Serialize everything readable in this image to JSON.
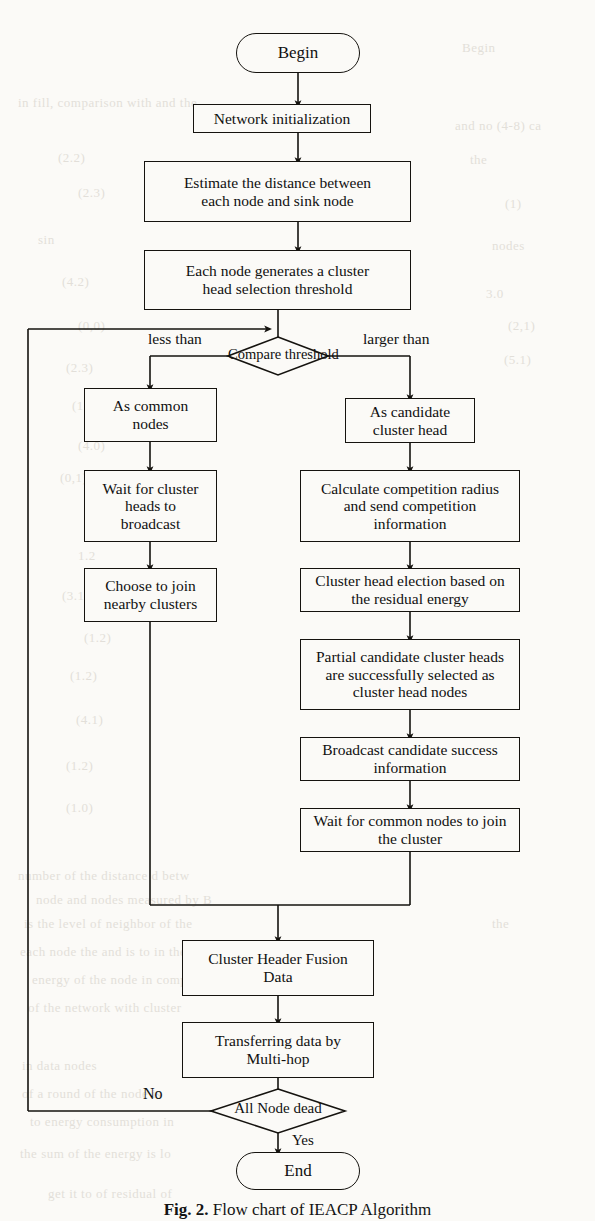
{
  "figure": {
    "caption_label": "Fig. 2.",
    "caption_text": "Flow chart of IEACP Algorithm",
    "background_color": "#fbfaf7",
    "line_color": "#15130f",
    "text_color": "#101010"
  },
  "nodes": {
    "begin": {
      "label": "Begin",
      "shape": "terminator"
    },
    "network_init": {
      "label": "Network initialization",
      "shape": "process"
    },
    "estimate_distance": {
      "label": "Estimate the distance between\neach node and sink node",
      "shape": "process"
    },
    "generate_threshold": {
      "label": "Each node generates a cluster\nhead selection threshold",
      "shape": "process"
    },
    "compare_threshold": {
      "label": "Compare threshold",
      "shape": "decision"
    },
    "as_common_nodes": {
      "label": "As common\nnodes",
      "shape": "process"
    },
    "wait_broadcast": {
      "label": "Wait for cluster\nheads to\nbroadcast",
      "shape": "process"
    },
    "choose_join": {
      "label": "Choose to join\nnearby clusters",
      "shape": "process"
    },
    "as_candidate": {
      "label": "As candidate\ncluster head",
      "shape": "process"
    },
    "calculate_radius": {
      "label": "Calculate competition radius\nand send competition\ninformation",
      "shape": "process"
    },
    "head_election": {
      "label": "Cluster head election based on\nthe residual energy",
      "shape": "process"
    },
    "partial_selected": {
      "label": "Partial candidate cluster heads\nare successfully selected as\ncluster head nodes",
      "shape": "process"
    },
    "broadcast_success": {
      "label": "Broadcast candidate success\ninformation",
      "shape": "process"
    },
    "wait_common_join": {
      "label": "Wait for common nodes to join\nthe cluster",
      "shape": "process"
    },
    "fusion_data": {
      "label": "Cluster Header Fusion\nData",
      "shape": "process"
    },
    "transfer_data": {
      "label": "Transferring data by\nMulti-hop",
      "shape": "process"
    },
    "all_node_dead": {
      "label": "All Node dead",
      "shape": "decision"
    },
    "end": {
      "label": "End",
      "shape": "terminator"
    }
  },
  "edge_labels": {
    "less_than": "less than",
    "larger_than": "larger than",
    "no": "No",
    "yes": "Yes"
  },
  "bleed_through": [
    {
      "text": "Begin",
      "x": 462,
      "y": 40
    },
    {
      "text": "in fill, comparison with  and  the",
      "x": 18,
      "y": 95
    },
    {
      "text": "and  no  (4-8)  ca",
      "x": 455,
      "y": 118
    },
    {
      "text": "(2.2)",
      "x": 58,
      "y": 150
    },
    {
      "text": "the",
      "x": 470,
      "y": 152
    },
    {
      "text": "(2.3)",
      "x": 78,
      "y": 185
    },
    {
      "text": "(1)",
      "x": 505,
      "y": 196
    },
    {
      "text": "sin",
      "x": 38,
      "y": 232
    },
    {
      "text": "nodes",
      "x": 492,
      "y": 238
    },
    {
      "text": "(4.2)",
      "x": 62,
      "y": 274
    },
    {
      "text": "3.0",
      "x": 486,
      "y": 286
    },
    {
      "text": "(0,0)",
      "x": 78,
      "y": 318
    },
    {
      "text": "(2,1)",
      "x": 508,
      "y": 318
    },
    {
      "text": "(2.3)",
      "x": 66,
      "y": 360
    },
    {
      "text": "(5.1)",
      "x": 504,
      "y": 352
    },
    {
      "text": "(1.1)",
      "x": 72,
      "y": 398
    },
    {
      "text": "(4.0)",
      "x": 78,
      "y": 438
    },
    {
      "text": "(0,1)",
      "x": 60,
      "y": 470
    },
    {
      "text": "(1.0)",
      "x": 84,
      "y": 508
    },
    {
      "text": "1.2",
      "x": 78,
      "y": 548
    },
    {
      "text": "(3.1)",
      "x": 62,
      "y": 588
    },
    {
      "text": "(1.2)",
      "x": 84,
      "y": 630
    },
    {
      "text": "(1.2)",
      "x": 70,
      "y": 668
    },
    {
      "text": "8",
      "x": 505,
      "y": 690
    },
    {
      "text": "(4.1)",
      "x": 76,
      "y": 712
    },
    {
      "text": "(1.2)",
      "x": 66,
      "y": 758
    },
    {
      "text": "(1.0)",
      "x": 66,
      "y": 800
    },
    {
      "text": "of M-SI",
      "x": 455,
      "y": 806
    },
    {
      "text": "number of the  distance  d  betw",
      "x": 18,
      "y": 868
    },
    {
      "text": "node  and  nodes  measured  by  B",
      "x": 36,
      "y": 892
    },
    {
      "text": "is the  level of  neighbor  of  the",
      "x": 24,
      "y": 916
    },
    {
      "text": "the",
      "x": 492,
      "y": 916
    },
    {
      "text": "each node the  and  is  to  in the",
      "x": 20,
      "y": 944
    },
    {
      "text": "energy  of  the  node  in  compa",
      "x": 32,
      "y": 972
    },
    {
      "text": "of  the  network  with  cluster",
      "x": 28,
      "y": 1000
    },
    {
      "text": "in data  nodes",
      "x": 22,
      "y": 1058
    },
    {
      "text": "of  a  round  of  the  node  is",
      "x": 22,
      "y": 1086
    },
    {
      "text": "to  energy  consumption  in",
      "x": 30,
      "y": 1114
    },
    {
      "text": "the  sum  of  the  energy  is  lo",
      "x": 20,
      "y": 1146
    },
    {
      "text": "get  it  to      of  residual      of",
      "x": 48,
      "y": 1186
    }
  ]
}
